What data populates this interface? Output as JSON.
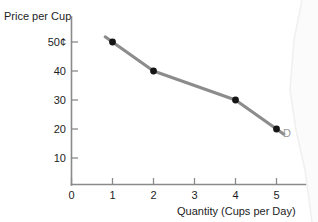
{
  "chart_data": {
    "type": "line",
    "title": "",
    "subtitle": "",
    "xlabel": "Quantity (Cups per Day)",
    "ylabel": "Price per Cup",
    "x": [
      1,
      2,
      4,
      5
    ],
    "values": [
      50,
      40,
      30,
      20
    ],
    "point_labels": [
      "50¢",
      "40",
      "30",
      "20"
    ],
    "series": [
      {
        "name": "D",
        "x": [
          1,
          2,
          4,
          5
        ],
        "values": [
          50,
          40,
          30,
          20
        ]
      }
    ],
    "annotations": [
      {
        "text": "D",
        "x": 5.35,
        "y": 17,
        "color": "#9a9a9a"
      }
    ],
    "x_ticks": [
      "0",
      "1",
      "2",
      "3",
      "4",
      "5"
    ],
    "x_tick_values": [
      0,
      1,
      2,
      3,
      4,
      5
    ],
    "y_ticks": [
      "10",
      "20",
      "30",
      "40",
      "50¢"
    ],
    "y_tick_values": [
      10,
      20,
      30,
      40,
      50
    ],
    "xlim": [
      0,
      5.9
    ],
    "ylim": [
      0,
      57
    ],
    "grid": false,
    "legend": "none",
    "colors": {
      "line": "#8c8c8c",
      "marker": "#151515",
      "axis": "#8a8a8a",
      "text": "#1d1d1d",
      "annotation": "#9a9a9a",
      "background": "#ffffff"
    }
  },
  "axis_titles": {
    "y": "Price per Cup",
    "x": "Quantity (Cups per Day)"
  },
  "curve_label": "D"
}
